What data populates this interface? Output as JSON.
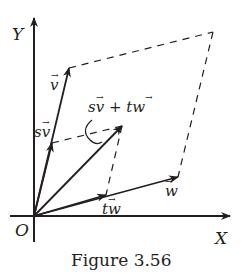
{
  "figure": {
    "caption": "Figure 3.56",
    "axes": {
      "x_label": "X",
      "y_label": "Y",
      "origin_label": "O"
    },
    "vectors": {
      "v": {
        "label": "v",
        "tip": [
          69,
          68
        ]
      },
      "w": {
        "label": "w",
        "tip": [
          178,
          177
        ]
      },
      "sv": {
        "label": "sv",
        "tip": [
          52,
          143
        ]
      },
      "tw": {
        "label": "tw",
        "tip": [
          106,
          195
        ]
      },
      "sv_plus_tw": {
        "label": "sv + tw",
        "tip": [
          122,
          126
        ]
      }
    },
    "parallelograms": {
      "outer": "v, v+w, w",
      "inner": "sv, sv+tw, tw"
    },
    "colors": {
      "ink": "#231f20",
      "background": "#ffffff"
    }
  }
}
